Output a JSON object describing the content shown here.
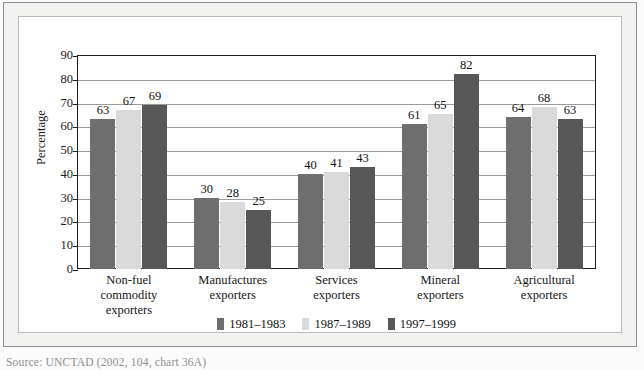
{
  "figure": {
    "source_note": "Source:   UNCTAD (2002, 104, chart 36A)"
  },
  "chart_data": {
    "type": "bar",
    "title": "",
    "xlabel": "",
    "ylabel": "Percentage",
    "ylim": [
      0,
      90
    ],
    "yticks": [
      0,
      10,
      20,
      30,
      40,
      50,
      60,
      70,
      80,
      90
    ],
    "ytick_labels": [
      "0",
      "10",
      "20",
      "30",
      "40",
      "50",
      "60",
      "70",
      "80",
      "90"
    ],
    "grid": true,
    "legend_position": "bottom",
    "categories": [
      "Non-fuel commodity\nexporters",
      "Manufactures\nexporters",
      "Services\nexporters",
      "Mineral\nexporters",
      "Agricultural\nexporters"
    ],
    "category_lines": [
      [
        "Non-fuel commodity",
        "exporters"
      ],
      [
        "Manufactures",
        "exporters"
      ],
      [
        "Services",
        "exporters"
      ],
      [
        "Mineral",
        "exporters"
      ],
      [
        "Agricultural",
        "exporters"
      ]
    ],
    "series": [
      {
        "name": "1981–1983",
        "color": "#6e6e6e",
        "values": [
          63,
          30,
          40,
          61,
          64
        ]
      },
      {
        "name": "1987–1989",
        "color": "#dadada",
        "values": [
          67,
          28,
          41,
          65,
          68
        ]
      },
      {
        "name": "1997–1999",
        "color": "#575757",
        "values": [
          69,
          25,
          43,
          82,
          63
        ]
      }
    ],
    "data_labels": [
      [
        "63",
        "67",
        "69"
      ],
      [
        "30",
        "28",
        "25"
      ],
      [
        "40",
        "41",
        "43"
      ],
      [
        "61",
        "65",
        "82"
      ],
      [
        "64",
        "68",
        "63"
      ]
    ]
  }
}
